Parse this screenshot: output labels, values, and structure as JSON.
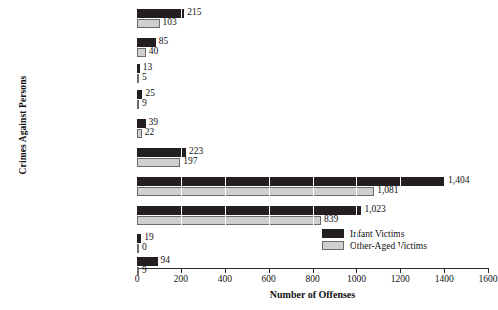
{
  "chart_data": {
    "type": "bar",
    "orientation": "horizontal",
    "title": "",
    "xlabel": "Number of Offenses",
    "ylabel": "Crimes Against Persons",
    "xlim": [
      0,
      1600
    ],
    "xticks": [
      0,
      200,
      400,
      600,
      800,
      1000,
      1200,
      1400,
      1600
    ],
    "xtick_labels": [
      "0",
      "200",
      "400",
      "600",
      "800",
      "1000",
      "1200",
      "1400",
      "1600"
    ],
    "grid": "vertical-white-gridlines",
    "legend_position": "inside-lower-right",
    "categories": [
      "Kidnapping/\nAbduction",
      "Forcible\nFondling",
      "Sexual Assault\nWith An Object",
      "Forcible Sodomy",
      "Forcible Rape",
      "Intimidation",
      "Simple Assault",
      "Aggravated\nAssault",
      "Negligent Manslaughter",
      "Murder/Nonnegligent\nManslaughter"
    ],
    "series": [
      {
        "name": "Infant Victims",
        "color": "#231f20",
        "values": [
          215,
          85,
          13,
          25,
          39,
          223,
          1404,
          1023,
          19,
          94
        ],
        "labels": [
          "215",
          "85",
          "13",
          "25",
          "39",
          "223",
          "1,404",
          "1,023",
          "19",
          "94"
        ]
      },
      {
        "name": "Other-Aged Victims",
        "color": "#cfcfcf",
        "values": [
          103,
          40,
          5,
          9,
          22,
          197,
          1081,
          839,
          0,
          9
        ],
        "labels": [
          "103",
          "40",
          "5",
          "9",
          "22",
          "197",
          "1,081",
          "839",
          "0",
          "9"
        ]
      }
    ]
  },
  "legend": {
    "items": [
      {
        "label": "Infant Victims",
        "swatch": "infant"
      },
      {
        "label": "Other-Aged Victims",
        "swatch": "other"
      }
    ]
  }
}
